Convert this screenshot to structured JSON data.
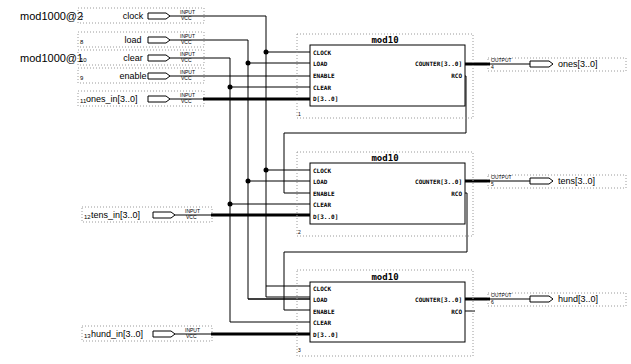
{
  "side_labels": {
    "group2": "mod1000@2",
    "group1": "mod1000@1"
  },
  "inputs": [
    {
      "num": "7",
      "name": "clock",
      "type": "INPUT",
      "default": "VCC"
    },
    {
      "num": "8",
      "name": "load",
      "type": "INPUT",
      "default": "VCC"
    },
    {
      "num": "10",
      "name": "clear",
      "type": "INPUT",
      "default": "VCC"
    },
    {
      "num": "9",
      "name": "enable",
      "type": "INPUT",
      "default": "VCC"
    },
    {
      "num": "11",
      "name": "ones_in[3..0]",
      "type": "INPUT",
      "default": "VCC"
    },
    {
      "num": "12",
      "name": "tens_in[3..0]",
      "type": "INPUT",
      "default": "VCC"
    },
    {
      "num": "13",
      "name": "hund_in[3..0]",
      "type": "INPUT",
      "default": "VCC"
    }
  ],
  "blocks": [
    {
      "title": "mod10",
      "instance": "1",
      "ports_in": [
        "CLOCK",
        "LOAD",
        "ENABLE",
        "CLEAR",
        "D[3..0]"
      ],
      "ports_out": [
        "COUNTER[3..0]",
        "RCO"
      ]
    },
    {
      "title": "mod10",
      "instance": "2",
      "ports_in": [
        "CLOCK",
        "LOAD",
        "ENABLE",
        "CLEAR",
        "D[3..0]"
      ],
      "ports_out": [
        "COUNTER[3..0]",
        "RCO"
      ]
    },
    {
      "title": "mod10",
      "instance": "3",
      "ports_in": [
        "CLOCK",
        "LOAD",
        "ENABLE",
        "CLEAR",
        "D[3..0]"
      ],
      "ports_out": [
        "COUNTER[3..0]",
        "RCO"
      ]
    }
  ],
  "outputs": [
    {
      "num": "4",
      "name": "ones[3..0]",
      "type": "OUTPUT"
    },
    {
      "num": "5",
      "name": "tens[3..0]",
      "type": "OUTPUT"
    },
    {
      "num": "6",
      "name": "hund[3..0]",
      "type": "OUTPUT"
    }
  ]
}
